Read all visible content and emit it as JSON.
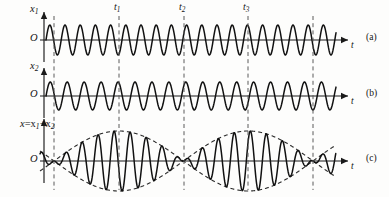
{
  "figure": {
    "width": 389,
    "height": 197,
    "origin_label": "O",
    "time_axis_label": "t"
  },
  "panels": [
    {
      "id": "a",
      "panel_label": "(a)",
      "y_axis_label_main": "x",
      "y_axis_label_sub": "1",
      "origin_label": "O",
      "time_axis_label": "t",
      "wave": {
        "kind": "sine",
        "period_px": 15.2,
        "amplitude_px": 15,
        "phase_deg": 0,
        "baseline_y": 40,
        "x_start": 46,
        "x_end": 336
      }
    },
    {
      "id": "b",
      "panel_label": "(b)",
      "y_axis_label_main": "x",
      "y_axis_label_sub": "2",
      "origin_label": "O",
      "time_axis_label": "t",
      "wave": {
        "kind": "sine",
        "period_px": 16.95,
        "amplitude_px": 14,
        "phase_deg": 0,
        "baseline_y": 96,
        "x_start": 46,
        "x_end": 336
      }
    },
    {
      "id": "c",
      "panel_label": "(c)",
      "y_axis_label_main": "x",
      "y_axis_label_sum": "=x",
      "y_axis_label_sub1": "1",
      "y_axis_label_plus": "+x",
      "y_axis_label_sub2": "2",
      "origin_label": "O",
      "time_axis_label": "t",
      "wave": {
        "kind": "beat-sum",
        "amplitude_px": 30,
        "baseline_y": 161,
        "x_start": 40,
        "x_end": 336,
        "envelope_node_spacing_px": 129.5,
        "envelope_first_node_x": 54
      }
    }
  ],
  "markers": [
    {
      "label": "t",
      "sub": "1",
      "x": 119,
      "show_label": true
    },
    {
      "label": "t",
      "sub": "2",
      "x": 184,
      "show_label": true
    },
    {
      "label": "t",
      "sub": "3",
      "x": 248,
      "show_label": true
    },
    {
      "label": "",
      "sub": "",
      "x": 54,
      "show_label": false
    },
    {
      "label": "",
      "sub": "",
      "x": 313,
      "show_label": false
    }
  ],
  "chart_data": {
    "type": "line",
    "xlabel": "t",
    "ylabel": "displacement",
    "grid": false,
    "legend": "none",
    "series": [
      {
        "name": "x1",
        "panel": "(a)",
        "form": "A1*sin(2*pi*t/T1)",
        "relative_period": 15.2,
        "relative_amplitude": 15,
        "cycles_drawn": 19
      },
      {
        "name": "x2",
        "panel": "(b)",
        "form": "A2*sin(2*pi*t/T2)",
        "relative_period": 16.95,
        "relative_amplitude": 14,
        "cycles_drawn": 17
      },
      {
        "name": "x = x1 + x2",
        "panel": "(c)",
        "form": "2A*cos(pi*(f1-f2)*t)*sin(pi*(f1+f2)*t)",
        "relative_amplitude": 30,
        "beat_period_px": 129.5,
        "beat_nodes_px": [
          54,
          184,
          313
        ]
      }
    ],
    "annotations": [
      {
        "text": "t1",
        "x_px": 119,
        "note": "amplitude maximum of beat envelope"
      },
      {
        "text": "t2",
        "x_px": 184,
        "note": "beat node, zero resultant amplitude"
      },
      {
        "text": "t3",
        "x_px": 248,
        "note": "amplitude maximum of beat envelope"
      }
    ]
  },
  "colors": {
    "ink": "#111111",
    "axis": "#1a1a1a",
    "dashed": "#5a5a5a",
    "background": "#fdfdfc"
  }
}
